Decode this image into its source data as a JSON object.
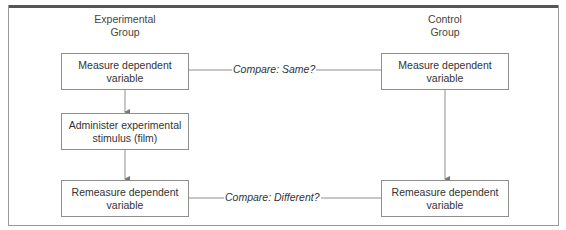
{
  "diagram": {
    "groups": {
      "experimental": {
        "label_line1": "Experimental",
        "label_line2": "Group"
      },
      "control": {
        "label_line1": "Control",
        "label_line2": "Group"
      }
    },
    "experimental_steps": [
      {
        "line1": "Measure dependent",
        "line2": "variable"
      },
      {
        "line1": "Administer experimental",
        "line2": "stimulus (film)"
      },
      {
        "line1": "Remeasure dependent",
        "line2": "variable"
      }
    ],
    "control_steps": [
      {
        "line1": "Measure dependent",
        "line2": "variable"
      },
      {
        "line1": "Remeasure dependent",
        "line2": "variable"
      }
    ],
    "comparisons": [
      {
        "label": "Compare: Same?"
      },
      {
        "label": "Compare: Different?"
      }
    ],
    "colors": {
      "line": "#8f8f8f",
      "frame_top": "#555555",
      "text": "#333333"
    }
  }
}
